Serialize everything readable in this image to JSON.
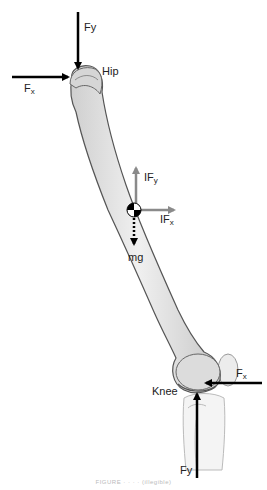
{
  "diagram": {
    "colors": {
      "bone_fill": "#e4e4e4",
      "bone_outline": "#555555",
      "joint_force_arrow": "#000000",
      "inertial_force_arrow": "#8a8a8a",
      "text": "#222222"
    },
    "labels": {
      "hip": "Hip",
      "knee": "Knee",
      "hip_fy": "F",
      "hip_fy_sub": "y",
      "hip_fx": "F",
      "hip_fx_sub": "x",
      "ify": "IF",
      "ify_sub": "y",
      "ifx": "IF",
      "ifx_sub": "x",
      "mg": "mg",
      "knee_fx": "F",
      "knee_fx_sub": "x",
      "knee_fy": "Fy"
    },
    "icons": {
      "center_of_mass": "center-of-mass-symbol"
    },
    "caption": "FIGURE · · · · (illegible)"
  }
}
